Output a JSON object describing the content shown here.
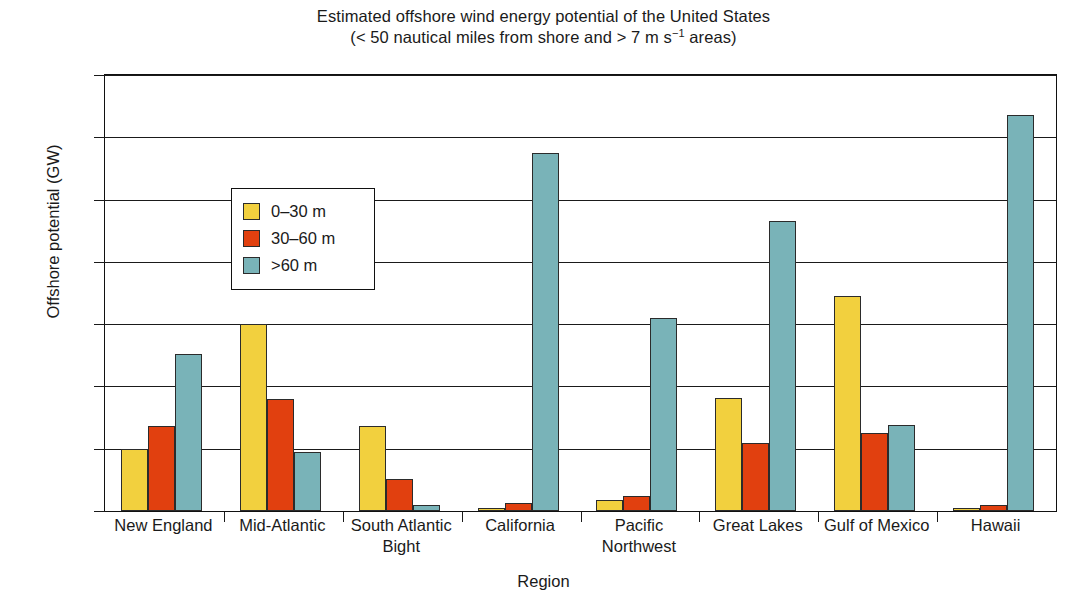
{
  "chart_data": {
    "type": "bar",
    "title": "Estimated offshore wind energy potential of the United States",
    "subtitle": "(< 50 nautical miles from shore and > 7 m s⁻¹ areas)",
    "subtitle_parts": {
      "before_sup": "(< 50 nautical miles from shore and > 7 m s",
      "sup": "−1",
      "after_sup": " areas)"
    },
    "xlabel": "Region",
    "ylabel": "Offshore potential (GW)",
    "ylim": [
      0,
      700
    ],
    "yticks": [
      0,
      100,
      200,
      300,
      400,
      500,
      600,
      700
    ],
    "ytick_labels": [
      "0",
      "100",
      "200",
      "300",
      "400",
      "500",
      "600",
      "700"
    ],
    "grid": true,
    "legend_position": "upper-left-inside",
    "categories": [
      "New England",
      "Mid-Atlantic",
      "South Atlantic Bight",
      "California",
      "Pacific Northwest",
      "Great Lakes",
      "Gulf of Mexico",
      "Hawaii"
    ],
    "category_lines": [
      [
        "New England"
      ],
      [
        "Mid-Atlantic"
      ],
      [
        "South Atlantic",
        "Bight"
      ],
      [
        "California"
      ],
      [
        "Pacific",
        "Northwest"
      ],
      [
        "Great Lakes"
      ],
      [
        "Gulf of Mexico"
      ],
      [
        "Hawaii"
      ]
    ],
    "series": [
      {
        "name": "0–30 m",
        "color": "#f2d03e",
        "values": [
          100,
          300,
          137,
          5,
          18,
          181,
          346,
          4
        ]
      },
      {
        "name": "30–60 m",
        "color": "#e1400f",
        "values": [
          137,
          180,
          51,
          13,
          24,
          110,
          125,
          10
        ]
      },
      {
        "name": ">60 m",
        "color": "#79b3b8",
        "values": [
          252,
          95,
          10,
          575,
          310,
          465,
          138,
          636
        ]
      }
    ]
  },
  "legend": {
    "items": [
      {
        "label": "0–30 m",
        "color": "#f2d03e",
        "swatch_name": "legend-swatch-0-30m"
      },
      {
        "label": "30–60 m",
        "color": "#e1400f",
        "swatch_name": "legend-swatch-30-60m"
      },
      {
        "label": ">60 m",
        "color": "#79b3b8",
        "swatch_name": "legend-swatch-over-60m"
      }
    ]
  },
  "colors": {
    "series_0_30m": "#f2d03e",
    "series_30_60m": "#e1400f",
    "series_over_60m": "#79b3b8",
    "axis": "#1a1a1a",
    "background": "#ffffff"
  }
}
